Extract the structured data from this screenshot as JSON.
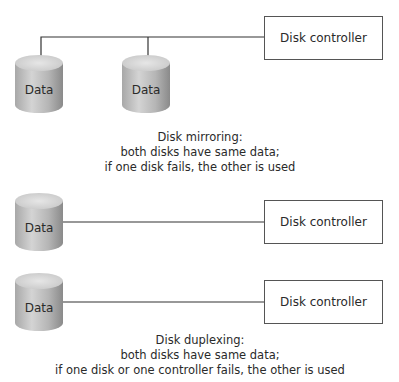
{
  "colors": {
    "line": "#333333",
    "cylinder_body_light": "#d0d0d0",
    "cylinder_body_dark": "#8f8f8f",
    "cylinder_top": "#d9d9d9",
    "box_border": "#555555",
    "text": "#2a2a2a"
  },
  "mirroring": {
    "disks": [
      {
        "label": "Data"
      },
      {
        "label": "Data"
      }
    ],
    "controller": {
      "label": "Disk controller"
    },
    "caption": {
      "line1": "Disk mirroring:",
      "line2": "both disks have same data;",
      "line3": "if one disk fails, the other is used"
    }
  },
  "duplexing": {
    "pairs": [
      {
        "disk": {
          "label": "Data"
        },
        "controller": {
          "label": "Disk controller"
        }
      },
      {
        "disk": {
          "label": "Data"
        },
        "controller": {
          "label": "Disk controller"
        }
      }
    ],
    "caption": {
      "line1": "Disk duplexing:",
      "line2": "both disks have same data;",
      "line3": "if one disk or one controller fails, the other is used"
    }
  }
}
